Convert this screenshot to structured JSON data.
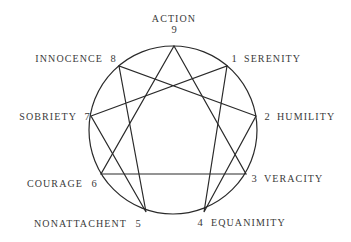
{
  "diagram": {
    "type": "enneagram",
    "circle": {
      "cx": 173,
      "cy": 130,
      "r": 84,
      "color": "#2a2a2a"
    },
    "points": [
      {
        "number": "9",
        "label": "ACTION",
        "x": 174,
        "y": 46
      },
      {
        "number": "1",
        "label": "SERENITY",
        "x": 227,
        "y": 66
      },
      {
        "number": "2",
        "label": "HUMILITY",
        "x": 256,
        "y": 116
      },
      {
        "number": "3",
        "label": "VERACITY",
        "x": 246,
        "y": 174
      },
      {
        "number": "4",
        "label": "EQUANIMITY",
        "x": 204,
        "y": 212
      },
      {
        "number": "5",
        "label": "NONATTACHENT",
        "x": 146,
        "y": 212
      },
      {
        "number": "6",
        "label": "COURAGE",
        "x": 101,
        "y": 174
      },
      {
        "number": "7",
        "label": "SOBRIETY",
        "x": 91,
        "y": 116
      },
      {
        "number": "8",
        "label": "INNOCENCE",
        "x": 119,
        "y": 66
      }
    ],
    "triangle": [
      "9",
      "3",
      "6"
    ],
    "hexad": [
      "1",
      "4",
      "2",
      "8",
      "5",
      "7"
    ],
    "labels": {
      "p9": {
        "name": "ACTION",
        "num": "9"
      },
      "p1": {
        "name": "SERENITY",
        "num": "1"
      },
      "p2": {
        "name": "HUMILITY",
        "num": "2"
      },
      "p3": {
        "name": "VERACITY",
        "num": "3"
      },
      "p4": {
        "name": "EQUANIMITY",
        "num": "4"
      },
      "p5": {
        "name": "NONATTACHENT",
        "num": "5"
      },
      "p6": {
        "name": "COURAGE",
        "num": "6"
      },
      "p7": {
        "name": "SOBRIETY",
        "num": "7"
      },
      "p8": {
        "name": "INNOCENCE",
        "num": "8"
      }
    }
  }
}
